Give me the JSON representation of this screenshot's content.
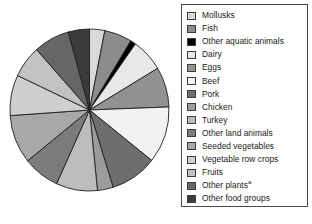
{
  "chart_data": {
    "type": "pie",
    "title": "",
    "subtitle": "",
    "xlabel": "",
    "ylabel": "",
    "grid": false,
    "legend_position": "right",
    "start_angle_deg": 0,
    "direction": "clockwise",
    "categories": [
      "Mollusks",
      "Fish",
      "Other aquatic animals",
      "Dairy",
      "Eggs",
      "Beef",
      "Pork",
      "Chicken",
      "Turkey",
      "Other land animals",
      "Seeded vegetables",
      "Vegetable row crops",
      "Fruits",
      "Other plants",
      "Other food groups"
    ],
    "values": [
      3.1,
      5.6,
      1.1,
      6.6,
      8.0,
      11.3,
      9.5,
      3.2,
      8.4,
      7.4,
      9.7,
      8.1,
      6.4,
      7.3,
      4.3
    ],
    "colors": [
      "#d9d9d9",
      "#8c8c8c",
      "#000000",
      "#e8e8e8",
      "#919191",
      "#f2f2f2",
      "#6e6e6e",
      "#9b9b9b",
      "#bdbdbd",
      "#7b7b7b",
      "#a8a8a8",
      "#cfcfcf",
      "#c2c2c2",
      "#666666",
      "#3b3b3b"
    ],
    "slice_edge_color": "#1f1f1f",
    "footnote_marker": "a"
  },
  "legend": {
    "items": [
      {
        "label": "Mollusks",
        "marker": ""
      },
      {
        "label": "Fish",
        "marker": ""
      },
      {
        "label": "Other aquatic animals",
        "marker": ""
      },
      {
        "label": "Dairy",
        "marker": ""
      },
      {
        "label": "Eggs",
        "marker": ""
      },
      {
        "label": "Beef",
        "marker": ""
      },
      {
        "label": "Pork",
        "marker": ""
      },
      {
        "label": "Chicken",
        "marker": ""
      },
      {
        "label": "Turkey",
        "marker": ""
      },
      {
        "label": "Other land animals",
        "marker": ""
      },
      {
        "label": "Seeded vegetables",
        "marker": ""
      },
      {
        "label": "Vegetable row crops",
        "marker": ""
      },
      {
        "label": "Fruits",
        "marker": ""
      },
      {
        "label": "Other plants",
        "marker": "a"
      },
      {
        "label": "Other food groups",
        "marker": ""
      }
    ]
  }
}
